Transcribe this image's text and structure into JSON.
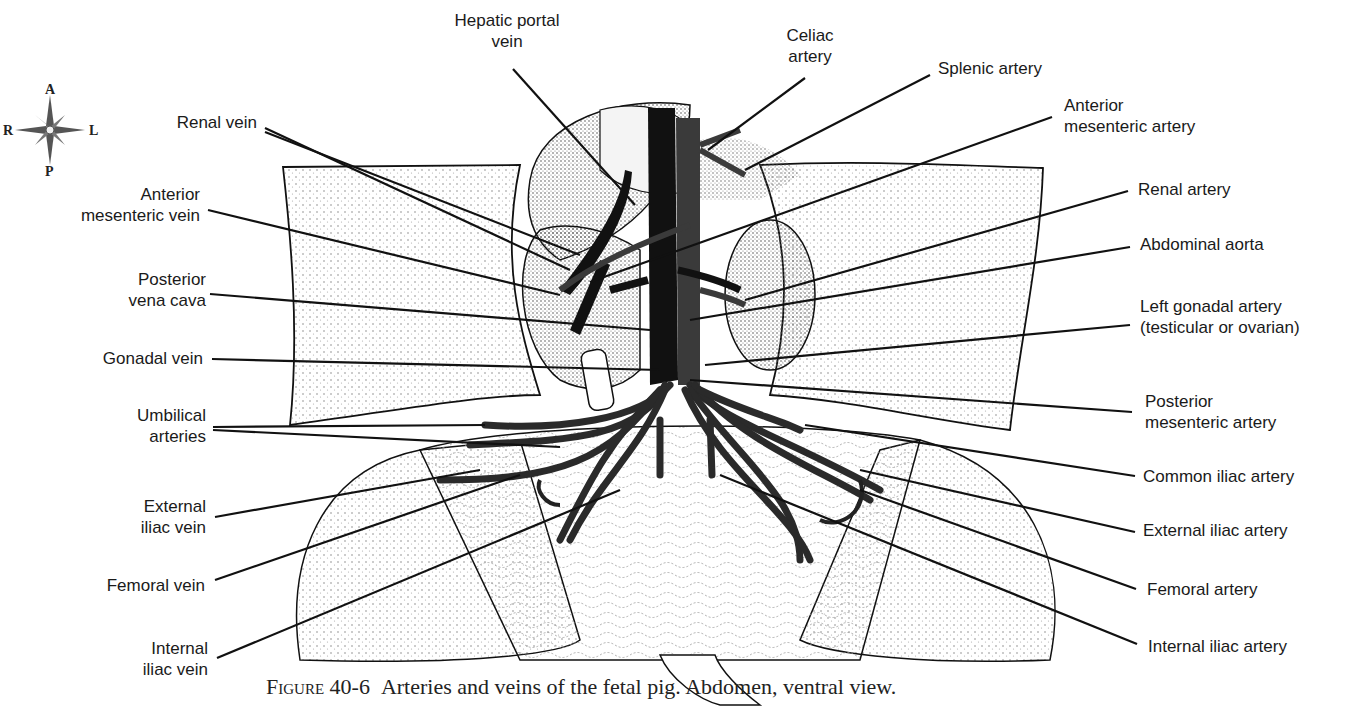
{
  "figure": {
    "number": "Figure 40-6",
    "caption": "Arteries and veins of the fetal pig. Abdomen, ventral view."
  },
  "compass": {
    "anterior": "A",
    "posterior": "P",
    "right": "R",
    "left": "L"
  },
  "labels": {
    "left": [
      {
        "id": "renal-vein",
        "text": "Renal vein"
      },
      {
        "id": "anterior-mesenteric-vein",
        "text": "Anterior\nmesenteric vein"
      },
      {
        "id": "posterior-vena-cava",
        "text": "Posterior\nvena cava"
      },
      {
        "id": "gonadal-vein",
        "text": "Gonadal vein"
      },
      {
        "id": "umbilical-arteries",
        "text": "Umbilical\narteries"
      },
      {
        "id": "external-iliac-vein",
        "text": "External\niliac vein"
      },
      {
        "id": "femoral-vein",
        "text": "Femoral vein"
      },
      {
        "id": "internal-iliac-vein",
        "text": "Internal\niliac vein"
      }
    ],
    "top": [
      {
        "id": "hepatic-portal-vein",
        "text": "Hepatic portal\nvein"
      },
      {
        "id": "celiac-artery",
        "text": "Celiac\nartery"
      }
    ],
    "right": [
      {
        "id": "splenic-artery",
        "text": "Splenic artery"
      },
      {
        "id": "anterior-mesenteric-artery",
        "text": "Anterior\nmesenteric artery"
      },
      {
        "id": "renal-artery",
        "text": "Renal artery"
      },
      {
        "id": "abdominal-aorta",
        "text": "Abdominal aorta"
      },
      {
        "id": "left-gonadal-artery",
        "text": "Left gonadal artery\n(testicular or ovarian)"
      },
      {
        "id": "posterior-mesenteric-artery",
        "text": "Posterior\nmesenteric artery"
      },
      {
        "id": "common-iliac-artery",
        "text": "Common iliac artery"
      },
      {
        "id": "external-iliac-artery",
        "text": "External iliac artery"
      },
      {
        "id": "femoral-artery",
        "text": "Femoral artery"
      },
      {
        "id": "internal-iliac-artery",
        "text": "Internal iliac artery"
      }
    ]
  },
  "colors": {
    "vein": "#111111",
    "artery": "#3a3a3a",
    "line": "#111111",
    "stipple": "#9a9a9a"
  }
}
